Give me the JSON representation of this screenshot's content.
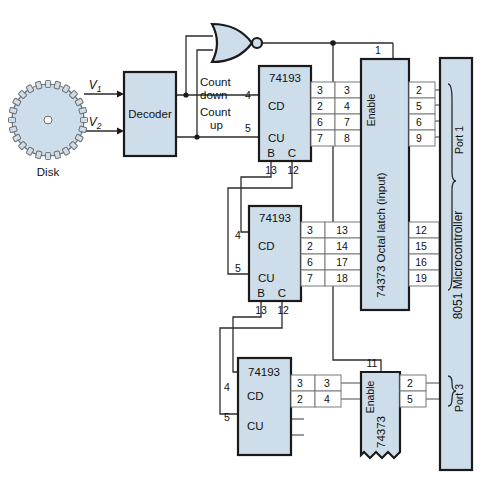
{
  "disk": {
    "label": "Disk",
    "icon": "gear-disk-icon"
  },
  "signals": {
    "v1": "V",
    "v1_sub": "1",
    "v2": "V",
    "v2_sub": "2"
  },
  "decoder": {
    "label": "Decoder"
  },
  "gate": {
    "name": "nor-gate",
    "label": ""
  },
  "counter_labels": {
    "count_down_line1": "Count",
    "count_down_line2": "down",
    "count_up_line1": "Count",
    "count_up_line2": "up",
    "cd_pin": "4",
    "cu_pin": "5"
  },
  "counters": [
    {
      "name": "74193",
      "cd_label": "CD",
      "cu_label": "CU",
      "cd_pin": "4",
      "cu_pin": "5",
      "b_label": "B",
      "c_label": "C",
      "b_pin": "13",
      "c_pin": "12",
      "out_pins": [
        "3",
        "2",
        "6",
        "7"
      ],
      "latch_pins": [
        "3",
        "4",
        "7",
        "8"
      ]
    },
    {
      "name": "74193",
      "cd_label": "CD",
      "cu_label": "CU",
      "cd_pin": "4",
      "cu_pin": "5",
      "b_label": "B",
      "c_label": "C",
      "b_pin": "13",
      "c_pin": "12",
      "out_pins": [
        "3",
        "2",
        "6",
        "7"
      ],
      "latch_pins": [
        "13",
        "14",
        "17",
        "18"
      ]
    },
    {
      "name": "74193",
      "cd_label": "CD",
      "cu_label": "CU",
      "cd_pin": "4",
      "cu_pin": "5",
      "b_label": "",
      "c_label": "",
      "b_pin": "",
      "c_pin": "",
      "out_pins": [
        "3",
        "2"
      ],
      "latch_pins": [
        "3",
        "4"
      ]
    }
  ],
  "latch_top": {
    "name": "74373 Octal latch (input)",
    "enable_label": "Enable",
    "enable_pin": "1",
    "out_pins_upper": [
      "2",
      "5",
      "6",
      "9"
    ],
    "out_pins_lower": [
      "12",
      "15",
      "16",
      "19"
    ]
  },
  "latch_bottom": {
    "name": "74373",
    "enable_label": "Enable",
    "enable_pin": "11",
    "out_pins": [
      "2",
      "5"
    ]
  },
  "microcontroller": {
    "name": "8051 Microcontroller",
    "port1_label": "Port 1",
    "port3_label": "Port 3"
  },
  "colors": {
    "block_fill": "#cdddea",
    "outline": "#1a1a1a",
    "wire": "#2b2b2b",
    "background": "#ffffff"
  }
}
